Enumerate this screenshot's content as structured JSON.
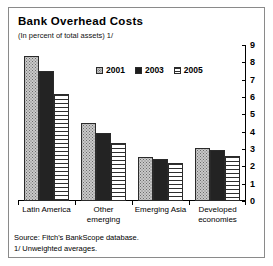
{
  "figure": {
    "title": "Bank Overhead Costs",
    "subtitle": "(In percent of total assets) 1/",
    "source_line": "Source: Fitch's BankScope database.",
    "note_line": "1/ Unweighted averages."
  },
  "chart_data": {
    "type": "bar",
    "title": "Bank Overhead Costs",
    "subtitle": "(In percent of total assets) 1/",
    "xlabel": "",
    "ylabel": "",
    "ylim": [
      0,
      9
    ],
    "yticks": [
      0,
      1,
      2,
      3,
      4,
      5,
      6,
      7,
      8,
      9
    ],
    "yaxis_position": "right",
    "grid": false,
    "legend_position": "top-center",
    "categories": [
      "Latin America",
      "Other emerging",
      "Emerging Asia",
      "Developed economies"
    ],
    "category_lines": [
      [
        "Latin America"
      ],
      [
        "Other",
        "emerging"
      ],
      [
        "Emerging Asia"
      ],
      [
        "Developed",
        "economies"
      ]
    ],
    "series": [
      {
        "name": "2001",
        "pattern": "dotted",
        "values": [
          8.35,
          4.5,
          2.55,
          3.05
        ]
      },
      {
        "name": "2003",
        "pattern": "solid-black",
        "values": [
          7.5,
          3.9,
          2.4,
          2.95
        ]
      },
      {
        "name": "2005",
        "pattern": "horizontal-stripes",
        "values": [
          6.2,
          3.35,
          2.2,
          2.6
        ]
      }
    ],
    "source": "Source: Fitch's BankScope database.",
    "note": "1/ Unweighted averages."
  },
  "colors": {
    "series_2001": "#c9c9c9",
    "series_2003": "#232323",
    "series_2005": "#ffffff",
    "axis": "#000000",
    "frame": "#8a8a8a",
    "background": "#ffffff"
  }
}
